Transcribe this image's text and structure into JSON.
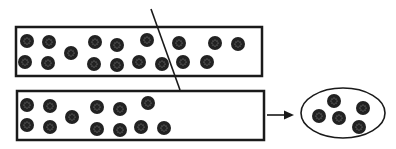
{
  "diagram": {
    "colors": {
      "stroke": "#1a1a1a",
      "dot": "#222222",
      "speck": "#9a9a9a",
      "background": "#ffffff"
    },
    "dot_radius": 7,
    "top_strip": {
      "rect": {
        "x": 16,
        "y": 27,
        "w": 246,
        "h": 49
      },
      "dots": [
        [
          27,
          41
        ],
        [
          49,
          42
        ],
        [
          71,
          53
        ],
        [
          95,
          42
        ],
        [
          117,
          45
        ],
        [
          147,
          40
        ],
        [
          179,
          43
        ],
        [
          215,
          43
        ],
        [
          238,
          44
        ],
        [
          25,
          62
        ],
        [
          48,
          63
        ],
        [
          94,
          64
        ],
        [
          117,
          65
        ],
        [
          139,
          62
        ],
        [
          162,
          64
        ],
        [
          183,
          62
        ],
        [
          207,
          62
        ]
      ]
    },
    "cut_line": {
      "x1": 151,
      "y1": 9,
      "x2": 180,
      "y2": 90
    },
    "bottom_strip": {
      "rect": {
        "x": 17,
        "y": 91,
        "w": 247,
        "h": 49
      },
      "dots": [
        [
          27,
          105
        ],
        [
          50,
          106
        ],
        [
          72,
          117
        ],
        [
          97,
          107
        ],
        [
          120,
          109
        ],
        [
          148,
          103
        ],
        [
          27,
          125
        ],
        [
          50,
          127
        ],
        [
          97,
          129
        ],
        [
          120,
          130
        ],
        [
          141,
          127
        ],
        [
          164,
          128
        ]
      ]
    },
    "arrow": {
      "x1": 267,
      "y1": 115,
      "x2": 294,
      "y2": 115
    },
    "container": {
      "ellipse": {
        "cx": 343,
        "cy": 113,
        "rx": 42,
        "ry": 25
      },
      "dots": [
        [
          334,
          101
        ],
        [
          319,
          116
        ],
        [
          339,
          118
        ],
        [
          363,
          108
        ],
        [
          359,
          127
        ]
      ]
    }
  }
}
